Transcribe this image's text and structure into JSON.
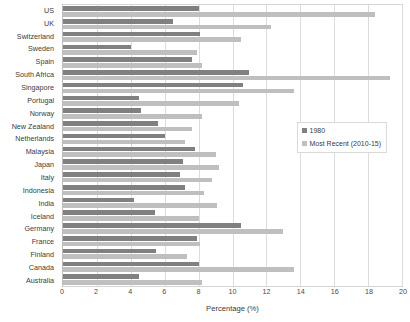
{
  "chart_data": {
    "type": "bar",
    "orientation": "horizontal",
    "title": "",
    "xlabel": "Percentage (%)",
    "ylabel": "",
    "xlim": [
      0,
      20
    ],
    "xticks": [
      0,
      2,
      4,
      6,
      8,
      10,
      12,
      14,
      16,
      18,
      20
    ],
    "grid": true,
    "legend_position": "middle-right",
    "categories": [
      "US",
      "UK",
      "Switzerland",
      "Sweden",
      "Spain",
      "South Africa",
      "Singapore",
      "Portugal",
      "Norway",
      "New Zealand",
      "Netherlands",
      "Malaysia",
      "Japan",
      "Italy",
      "Indonesia",
      "India",
      "Iceland",
      "Germany",
      "France",
      "Finland",
      "Canada",
      "Australia"
    ],
    "series": [
      {
        "name": "1980",
        "color": "#808080",
        "values": [
          8.0,
          6.5,
          8.1,
          4.0,
          7.6,
          11.0,
          10.6,
          4.5,
          4.6,
          5.6,
          6.0,
          7.8,
          7.1,
          6.9,
          7.2,
          4.2,
          5.4,
          10.5,
          7.9,
          5.5,
          8.0,
          4.5
        ]
      },
      {
        "name": "Most Recent (2010-15)",
        "color": "#bfbfbf",
        "values": [
          18.4,
          12.3,
          10.5,
          7.9,
          8.2,
          19.3,
          13.6,
          10.4,
          8.2,
          7.6,
          7.2,
          9.0,
          9.2,
          8.8,
          8.3,
          9.1,
          8.0,
          13.0,
          8.1,
          7.3,
          13.6,
          8.2
        ]
      }
    ]
  },
  "legend": {
    "entries": [
      {
        "label": "1980"
      },
      {
        "label": "Most Recent (2010-15)"
      }
    ]
  }
}
